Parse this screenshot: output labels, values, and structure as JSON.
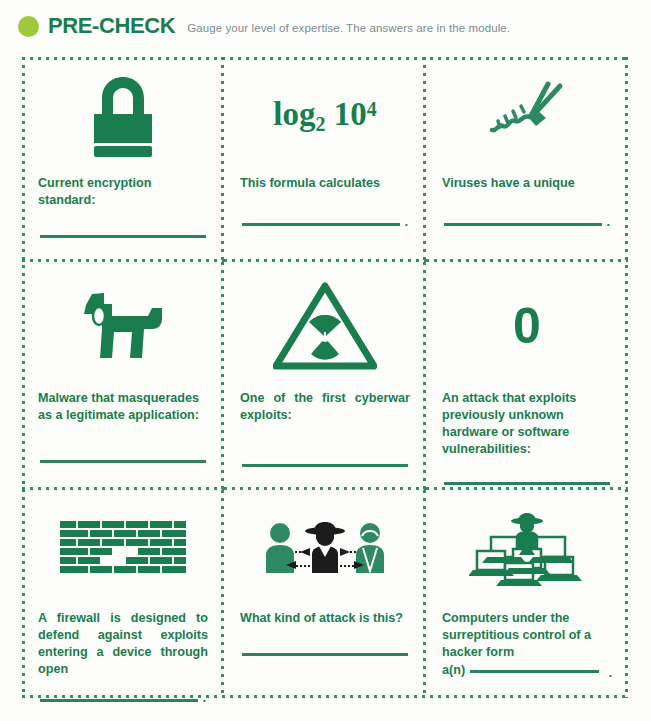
{
  "header": {
    "bullet_color": "#9ec93f",
    "title": "PRE-CHECK",
    "subtitle": "Gauge your level of expertise. The answers are in the module."
  },
  "theme": {
    "green": "#1a7d4e",
    "dotted_border": "#2f8e6a",
    "line": "#2c7f60",
    "background": "#fdfdfb",
    "subtitle_gray": "#7d8a92"
  },
  "cells": [
    {
      "icon": "padlock-icon",
      "prompt": "Current encryption standard:",
      "answer_line": true,
      "trailing_period": false,
      "inline": false
    },
    {
      "icon": "log-formula",
      "formula_base": "log",
      "formula_sub": "2",
      "formula_operand": "10",
      "formula_exponent": "4",
      "prompt": "This formula calculates",
      "answer_line": true,
      "trailing_period": true,
      "inline": false
    },
    {
      "icon": "virus-bacteriophage-icon",
      "prompt": "Viruses have a unique",
      "answer_line": true,
      "trailing_period": true,
      "inline": false
    },
    {
      "icon": "trojan-horse-icon",
      "prompt": "Malware that masquerades as a legitimate application:",
      "answer_line": true,
      "trailing_period": false,
      "inline": false
    },
    {
      "icon": "radiation-warning-icon",
      "prompt": "One of the first cyberwar exploits:",
      "answer_line": true,
      "trailing_period": false,
      "inline": false
    },
    {
      "icon": "zero-digit",
      "zero_glyph": "0",
      "prompt": "An attack that exploits previously unknown hardware or software vulnerabilities:",
      "answer_line": true,
      "trailing_period": false,
      "inline": false
    },
    {
      "icon": "brick-wall-firewall-icon",
      "prompt": "A firewall is designed to defend against exploits entering a device through open",
      "answer_line": true,
      "trailing_period": true,
      "inline": false
    },
    {
      "icon": "man-in-the-middle-icon",
      "prompt": "What kind of attack is this?",
      "answer_line": true,
      "trailing_period": false,
      "inline": false
    },
    {
      "icon": "botnet-hacker-laptops-icon",
      "prompt": "Computers under the surreptitious control of a hacker form",
      "inline_prefix": "a(n)",
      "answer_line": true,
      "trailing_period": true,
      "inline": true
    }
  ]
}
